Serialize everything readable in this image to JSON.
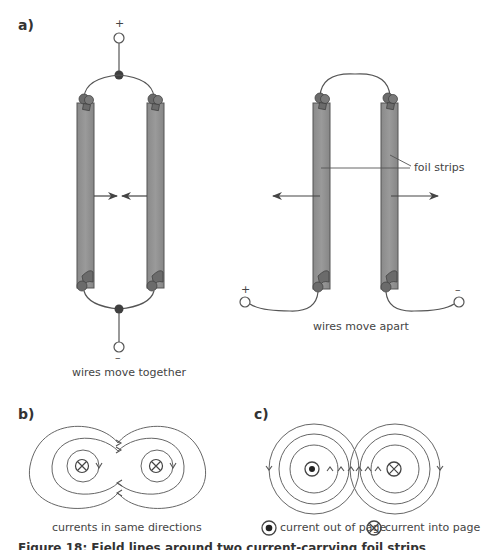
{
  "panels": {
    "a": {
      "label": "a)",
      "left_setup": {
        "top_terminal": "+",
        "bottom_terminal": "–",
        "caption": "wires move together",
        "force_direction": "toward each other"
      },
      "right_setup": {
        "left_terminal": "+",
        "right_terminal": "–",
        "callout": "foil strips",
        "caption": "wires move apart",
        "force_direction": "away from each other"
      }
    },
    "b": {
      "label": "b)",
      "caption": "currents in same directions",
      "left_conductor": "current-into-page",
      "right_conductor": "current-into-page"
    },
    "c": {
      "label": "c)",
      "left_conductor": "current-out-of-page",
      "right_conductor": "current-into-page",
      "legend": [
        {
          "icon": "dot-in-circle-icon",
          "label": "current out of page"
        },
        {
          "icon": "cross-in-circle-icon",
          "label": "current into page"
        }
      ]
    }
  },
  "figure_caption": "Figure 18: Field lines around two current-carrying foil strips",
  "colors": {
    "foil": "#8c8c8c",
    "foil_edge": "#555555",
    "clip": "#6e6e6e",
    "line": "#555555",
    "text": "#444444"
  }
}
